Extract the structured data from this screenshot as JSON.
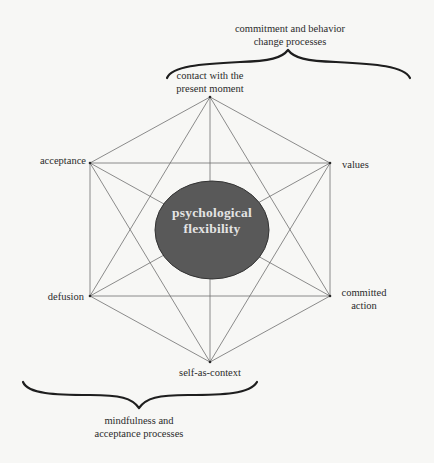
{
  "diagram": {
    "type": "hexaflex",
    "center": {
      "label": "psychological\nflexibility",
      "fill_color": "#595959",
      "stroke_color": "#333333",
      "text_color": "#e4e4e4"
    },
    "nodes": [
      {
        "id": "present_moment",
        "label": "contact with the\npresent moment",
        "position": "top"
      },
      {
        "id": "values",
        "label": "values",
        "position": "upper-right"
      },
      {
        "id": "committed_action",
        "label": "committed\naction",
        "position": "lower-right"
      },
      {
        "id": "self_as_context",
        "label": "self-as-context",
        "position": "bottom"
      },
      {
        "id": "defusion",
        "label": "defusion",
        "position": "lower-left"
      },
      {
        "id": "acceptance",
        "label": "acceptance",
        "position": "upper-left"
      }
    ],
    "edges": "all pairs connected (hexagon edges and all diagonals)",
    "groups": [
      {
        "label": "commitment and behavior\nchange processes",
        "brace_position": "top-right",
        "covers": [
          "present_moment",
          "values",
          "committed_action",
          "self_as_context"
        ]
      },
      {
        "label": "mindfulness and\nacceptance processes",
        "brace_position": "bottom-left",
        "covers": [
          "acceptance",
          "defusion",
          "self_as_context",
          "present_moment"
        ]
      }
    ],
    "colors": {
      "background": "#f7f7f5",
      "line": "#6e6e6e",
      "brace": "#1e1e1e",
      "text": "#2b2b2b"
    }
  }
}
